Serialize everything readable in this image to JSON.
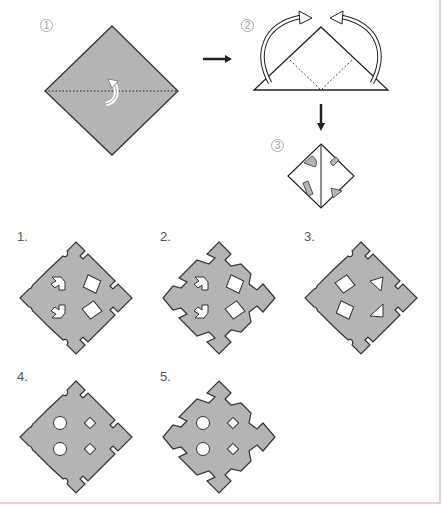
{
  "instructions": {
    "steps": [
      {
        "label": "1",
        "description": "Square sheet folded in half along the diagonal (dotted line), fold arrow"
      },
      {
        "label": "2",
        "description": "Triangle with both corners folded up to the top (curved arrows), dotted fold lines"
      },
      {
        "label": "3",
        "description": "Folded square with cut-out shapes marked"
      }
    ],
    "arrows": [
      "right-arrow",
      "down-arrow"
    ]
  },
  "patterns": [
    {
      "label": "1.",
      "holes_left": "arrow",
      "holes_right": "diamond",
      "edge": "notched"
    },
    {
      "label": "2.",
      "holes_left": "arrow",
      "holes_right": "diamond",
      "edge": "jagged"
    },
    {
      "label": "3.",
      "holes_left": "diamond",
      "holes_right": "triangle",
      "edge": "notched"
    },
    {
      "label": "4.",
      "holes_left": "circle",
      "holes_right": "small-square",
      "edge": "notched"
    },
    {
      "label": "5.",
      "holes_left": "circle",
      "holes_right": "small-square",
      "edge": "jagged"
    }
  ],
  "colors": {
    "paper": "#b4b4b4",
    "stroke": "#333333",
    "frame": "#f2c9d6"
  }
}
